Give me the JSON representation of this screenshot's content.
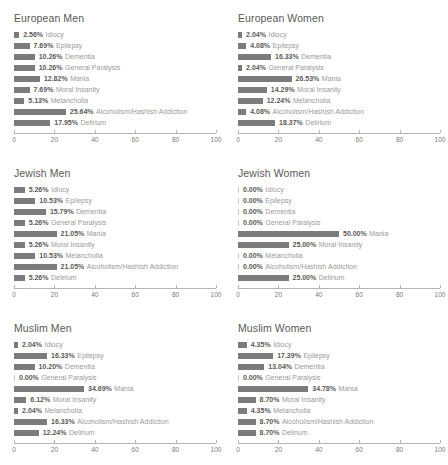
{
  "chart_data": {
    "type": "bar",
    "title": "",
    "xlabel": "",
    "ylabel": "",
    "xlim": [
      0,
      100
    ],
    "grid": false,
    "legend": null,
    "orientation": "horizontal",
    "axis_ticks": [
      0,
      20,
      40,
      60,
      80,
      100
    ],
    "axis_tick_labels": [
      "0",
      "20",
      "40",
      "60",
      "80",
      "100"
    ],
    "categories": [
      "Idiocy",
      "Epilepsy",
      "Dementia",
      "General Paralysis",
      "Mania",
      "Moral Insanity",
      "Melancholia",
      "Alcoholism/Hashish Addiction",
      "Delirium"
    ],
    "bar_color": "#7c7c7c",
    "panels": [
      {
        "title": "European Men",
        "values": [
          2.56,
          7.69,
          10.26,
          10.26,
          12.82,
          7.69,
          5.13,
          25.64,
          17.95
        ],
        "value_labels": [
          "2.56%",
          "7.69%",
          "10.26%",
          "10.26%",
          "12.82%",
          "7.69%",
          "5.13%",
          "25.64%",
          "17.95%"
        ]
      },
      {
        "title": "European Women",
        "values": [
          2.04,
          4.08,
          16.33,
          2.04,
          26.53,
          14.29,
          12.24,
          4.08,
          18.37
        ],
        "value_labels": [
          "2.04%",
          "4.08%",
          "16.33%",
          "2.04%",
          "26.53%",
          "14.29%",
          "12.24%",
          "4.08%",
          "18.37%"
        ]
      },
      {
        "title": "Jewish Men",
        "values": [
          5.26,
          10.53,
          15.79,
          5.26,
          21.05,
          5.26,
          10.53,
          21.05,
          5.26
        ],
        "value_labels": [
          "5.26%",
          "10.53%",
          "15.79%",
          "5.26%",
          "21.05%",
          "5.26%",
          "10.53%",
          "21.05%",
          "5.26%"
        ]
      },
      {
        "title": "Jewish Women",
        "values": [
          0.0,
          0.0,
          0.0,
          0.0,
          50.0,
          25.0,
          0.0,
          0.0,
          25.0
        ],
        "value_labels": [
          "0.00%",
          "0.00%",
          "0.00%",
          "0.00%",
          "50.00%",
          "25.00%",
          "0.00%",
          "0.00%",
          "25.00%"
        ]
      },
      {
        "title": "Muslim Men",
        "values": [
          2.04,
          16.33,
          10.2,
          0.0,
          34.69,
          6.12,
          2.04,
          16.33,
          12.24
        ],
        "value_labels": [
          "2.04%",
          "16.33%",
          "10.20%",
          "0.00%",
          "34.69%",
          "6.12%",
          "2.04%",
          "16.33%",
          "12.24%"
        ]
      },
      {
        "title": "Muslim Women",
        "values": [
          4.35,
          17.39,
          13.04,
          0.0,
          34.78,
          8.7,
          4.35,
          8.7,
          8.7
        ],
        "value_labels": [
          "4.35%",
          "17.39%",
          "13.04%",
          "0.00%",
          "34.78%",
          "8.70%",
          "4.35%",
          "8.70%",
          "8.70%"
        ]
      }
    ]
  }
}
